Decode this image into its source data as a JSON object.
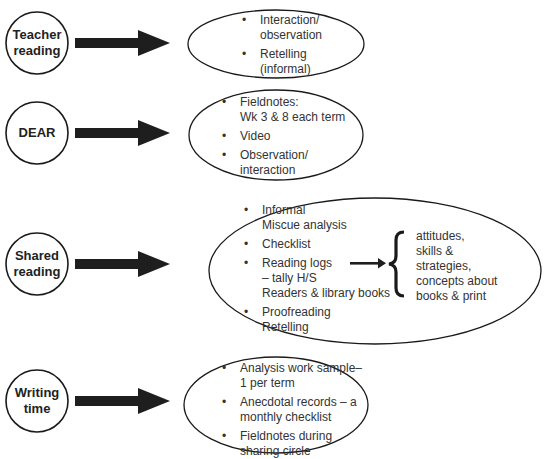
{
  "rows": [
    {
      "activity": [
        "Teacher",
        "reading"
      ],
      "methods": [
        [
          "Interaction/",
          "observation"
        ],
        [
          "Retelling",
          "(informal)"
        ]
      ]
    },
    {
      "activity": [
        "DEAR"
      ],
      "methods": [
        [
          "Fieldnotes:",
          "Wk 3 & 8 each term"
        ],
        [
          "Video"
        ],
        [
          "Observation/",
          "interaction"
        ]
      ]
    },
    {
      "activity": [
        "Shared",
        "reading"
      ],
      "methods": [
        [
          "Informal",
          "Miscue analysis"
        ],
        [
          "Checklist"
        ],
        [
          "Reading logs",
          "– tally H/S",
          "Readers & library books"
        ],
        [
          "Proofreading",
          "Retelling"
        ]
      ],
      "outcomes": [
        "attitudes,",
        "skills &",
        "strategies,",
        "concepts about",
        "books & print"
      ]
    },
    {
      "activity": [
        "Writing",
        "time"
      ],
      "methods": [
        [
          "Analysis work sample–",
          "1 per term"
        ],
        [
          "Anecdotal records – a",
          "monthly checklist"
        ],
        [
          "Fieldnotes during",
          "sharing circle"
        ]
      ]
    }
  ],
  "colors": {
    "stroke": "#1a1a1a",
    "arrow": "#1e1e1e",
    "text": "#333333"
  }
}
